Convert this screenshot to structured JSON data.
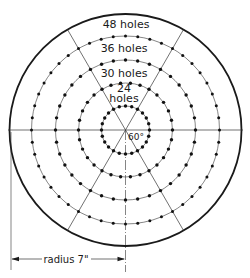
{
  "diagram": {
    "colors": {
      "ink": "#1a1a1a",
      "thin": "#333333",
      "background": "#ffffff"
    },
    "center": {
      "x": 125.5,
      "y": 130
    },
    "outer_radius": 116,
    "rings": [
      {
        "holes": 24,
        "radius": 24,
        "label_line1": "24",
        "label_line2": "holes"
      },
      {
        "holes": 30,
        "radius": 47,
        "label": "30 holes"
      },
      {
        "holes": 36,
        "radius": 70,
        "label": "36 holes"
      },
      {
        "holes": 48,
        "radius": 94,
        "label": "48 holes"
      }
    ],
    "radial_line_angles_deg": [
      0,
      60,
      120
    ],
    "angle_label": "60°",
    "dimension": {
      "label": "radius 7\"",
      "value": "7\"",
      "y": 259
    }
  }
}
